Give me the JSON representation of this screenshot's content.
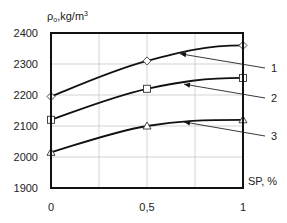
{
  "chart_data": {
    "type": "line",
    "title": "",
    "xlabel": "SP, %",
    "ylabel": "ρ₀,kg/m³",
    "ylabel_parts": {
      "main": "ρ",
      "sub": "о",
      "rest": ",kg/m",
      "sup": "3"
    },
    "x": [
      0,
      0.5,
      1
    ],
    "x_tick_labels": [
      "0",
      "0,5",
      "1"
    ],
    "y_ticks": [
      1900,
      2000,
      2100,
      2200,
      2300,
      2400
    ],
    "xlim": [
      0,
      1
    ],
    "ylim": [
      1900,
      2400
    ],
    "grid": true,
    "legend_position": "right (numbered leader lines)",
    "series": [
      {
        "name": "1",
        "marker": "diamond",
        "values": [
          2195,
          2310,
          2360
        ]
      },
      {
        "name": "2",
        "marker": "square",
        "values": [
          2120,
          2220,
          2255
        ]
      },
      {
        "name": "3",
        "marker": "triangle",
        "values": [
          2015,
          2100,
          2120
        ]
      }
    ]
  },
  "colors": {
    "line": "#111111",
    "grid": "#c8c8c8",
    "marker_fill": "#ffffff"
  }
}
